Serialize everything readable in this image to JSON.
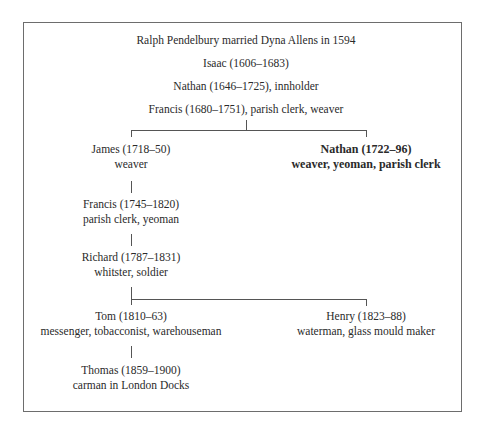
{
  "tree": {
    "root": "Ralph Pendelbury married Dyna Allens in 1594",
    "gen2": "Isaac (1606–1683)",
    "gen3": "Nathan (1646–1725), innholder",
    "gen4": "Francis (1680–1751), parish clerk, weaver",
    "james": {
      "name": "James (1718–50)",
      "occupation": "weaver"
    },
    "nathan2": {
      "name": "Nathan (1722–96)",
      "occupation": "weaver, yeoman, parish clerk"
    },
    "francis2": {
      "name": "Francis (1745–1820)",
      "occupation": "parish clerk, yeoman"
    },
    "richard": {
      "name": "Richard (1787–1831)",
      "occupation": "whitster, soldier"
    },
    "tom": {
      "name": "Tom (1810–63)",
      "occupation": "messenger, tobacconist, warehouseman"
    },
    "henry": {
      "name": "Henry (1823–88)",
      "occupation": "waterman, glass mould maker"
    },
    "thomas": {
      "name": "Thomas (1859–1900)",
      "occupation": "carman in London Docks"
    }
  }
}
